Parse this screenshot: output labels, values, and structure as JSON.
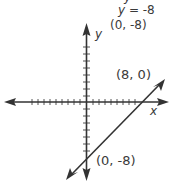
{
  "top_partial_text": "y",
  "equation": {
    "var": "y",
    "rest": " = -8"
  },
  "header_point": "(0, -8)",
  "axes": {
    "x_label": "x",
    "y_label": "y"
  },
  "points": [
    {
      "label": "(8, 0)",
      "x": 8,
      "y": 0
    },
    {
      "label": "(0, -8)",
      "x": 0,
      "y": -8
    }
  ],
  "line": {
    "slope": 1,
    "y_intercept": -8,
    "x_intercept": 8
  },
  "colors": {
    "ink": "#333333",
    "tick": "#555555"
  }
}
